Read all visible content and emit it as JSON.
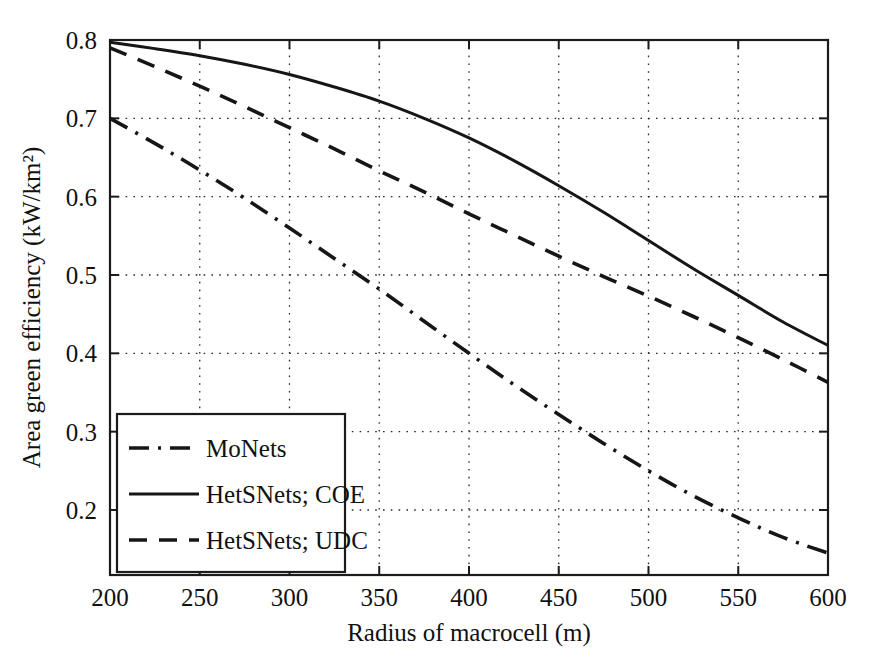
{
  "chart_data": {
    "type": "line",
    "title": "",
    "xlabel": "Radius of macrocell (m)",
    "ylabel": "Area green efficiency (kW/km²)",
    "xlim": [
      200,
      600
    ],
    "ylim": [
      0.1,
      0.8
    ],
    "grid": true,
    "legend_position": "lower left",
    "xticks": [
      200,
      250,
      300,
      350,
      400,
      450,
      500,
      550,
      600
    ],
    "xtick_labels": [
      "200",
      "250",
      "300",
      "350",
      "400",
      "450",
      "500",
      "550",
      "600"
    ],
    "yticks": [
      0.2,
      0.3,
      0.4,
      0.5,
      0.6,
      0.7,
      0.8
    ],
    "ytick_labels": [
      "0.2",
      "0.3",
      "0.4",
      "0.5",
      "0.6",
      "0.7",
      "0.8"
    ],
    "x": [
      200,
      225,
      250,
      275,
      300,
      325,
      350,
      375,
      400,
      425,
      450,
      475,
      500,
      525,
      550,
      575,
      600
    ],
    "series": [
      {
        "name": "MoNets",
        "style": "dashdot",
        "values": [
          0.7,
          0.668,
          0.634,
          0.598,
          0.56,
          0.521,
          0.482,
          0.441,
          0.4,
          0.36,
          0.322,
          0.285,
          0.25,
          0.218,
          0.19,
          0.165,
          0.145
        ]
      },
      {
        "name": "HetSNets; COE",
        "style": "solid",
        "values": [
          0.797,
          0.789,
          0.78,
          0.769,
          0.756,
          0.74,
          0.722,
          0.7,
          0.675,
          0.646,
          0.614,
          0.58,
          0.544,
          0.508,
          0.474,
          0.44,
          0.41
        ]
      },
      {
        "name": "HetSNets; UDC",
        "style": "dashed",
        "values": [
          0.79,
          0.766,
          0.741,
          0.715,
          0.688,
          0.661,
          0.633,
          0.606,
          0.578,
          0.551,
          0.524,
          0.498,
          0.473,
          0.447,
          0.42,
          0.392,
          0.363
        ]
      }
    ]
  },
  "legend": {
    "entries": [
      {
        "label": "MoNets",
        "style": "dashdot"
      },
      {
        "label": "HetSNets; COE",
        "style": "solid"
      },
      {
        "label": "HetSNets; UDC",
        "style": "dashed"
      }
    ]
  }
}
